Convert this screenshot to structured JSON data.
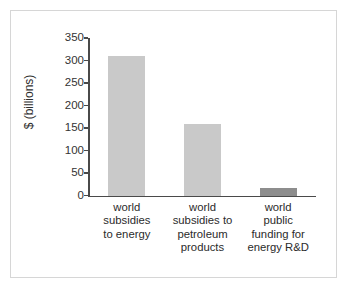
{
  "figure": {
    "background_color": "#ffffff",
    "border_color": "#d6d6d6"
  },
  "chart_data": {
    "type": "bar",
    "title": "",
    "subtitle": "",
    "xlabel": "",
    "ylabel": "$ (billions)",
    "categories": [
      "world\nsubsidies\nto energy",
      "world\nsubsidies to\npetroleum\nproducts",
      "world\npublic\nfunding for\nenergy R&D"
    ],
    "values": [
      310,
      158,
      17
    ],
    "ylim": [
      0,
      350
    ],
    "yticks": [
      0,
      50,
      100,
      150,
      200,
      250,
      300,
      350
    ],
    "ytick_labels": [
      "0",
      "50",
      "100",
      "150",
      "200",
      "250",
      "300",
      "350"
    ],
    "grid": false,
    "legend": false,
    "bar_colors": [
      "#c9c9c9",
      "#c9c9c9",
      "#8d8d8d"
    ],
    "axis_color": "#4a4a4a"
  }
}
